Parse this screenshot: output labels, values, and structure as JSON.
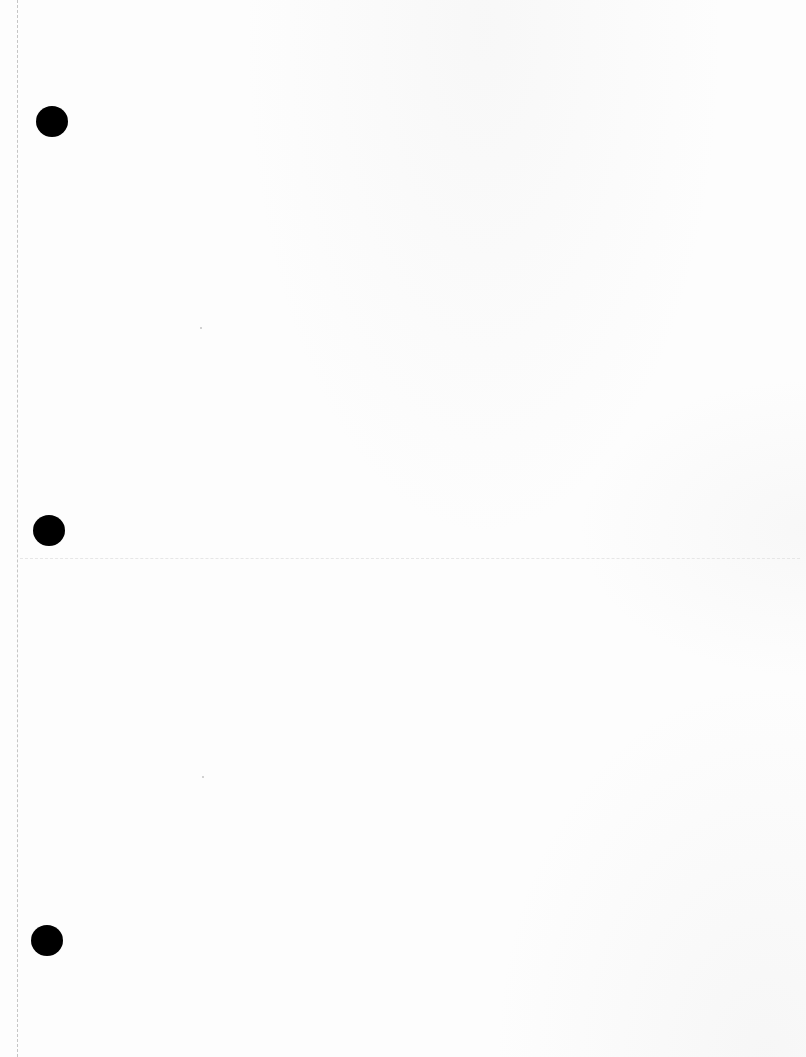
{
  "document": {
    "type": "blank-page-scan",
    "text": "",
    "hole_punches": [
      {
        "x": 36,
        "y": 106,
        "w": 32,
        "h": 31
      },
      {
        "x": 33,
        "y": 515,
        "w": 32,
        "h": 31
      },
      {
        "x": 31,
        "y": 925,
        "w": 31,
        "h": 31
      }
    ],
    "colors": {
      "paper": "#fdfdfd",
      "hole": "#000000",
      "margin_line": "#b8b8b8"
    }
  }
}
